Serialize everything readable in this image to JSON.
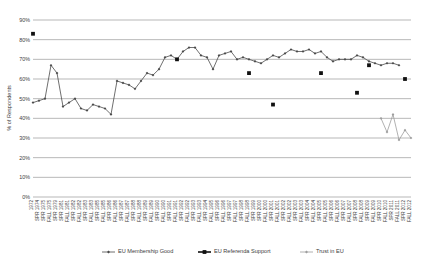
{
  "chart_data": {
    "type": "line",
    "title": "",
    "xlabel": "",
    "ylabel": "% of Respondents",
    "ylim": [
      0,
      90
    ],
    "ytick_step": 10,
    "ytick_labels": [
      "0%",
      "10%",
      "20%",
      "30%",
      "40%",
      "50%",
      "60%",
      "70%",
      "80%",
      "90%"
    ],
    "grid": true,
    "legend_position": "bottom",
    "categories": [
      "1972",
      "SPR 1974",
      "SPR 1975",
      "FALL 1975",
      "SPR 1979",
      "SPR 1981",
      "FALL 1981",
      "SPR 1982",
      "FALL 1982",
      "SPR 1983",
      "FALL 1983",
      "SPR 1985",
      "FALL 1985",
      "SPR 1986",
      "FALL 1986",
      "SPR 1987",
      "FALL 1987",
      "SPR 1988",
      "FALL 1988",
      "SPR 1989",
      "FALL 1989",
      "SPR 1990",
      "FALL 1990",
      "SPR 1991",
      "FALL 1991",
      "SPR 1992",
      "FALL 1992",
      "SPR 1993",
      "FALL 1993",
      "SPR 1994",
      "FALL 1995",
      "SPR 1996",
      "FALL 1996",
      "SPR 1997",
      "FALL 1997",
      "SPR 1998",
      "FALL 1998",
      "SPR 1999",
      "SPR 2000",
      "FALL 2000",
      "SPR 2001",
      "FALL 2001",
      "SPR 2002",
      "FALL 2002",
      "SPR 2003",
      "FALL 2003",
      "SPR 2004",
      "FALL 2004",
      "SPR 2005",
      "FALL 2005",
      "SPR 2006",
      "FALL 2006",
      "SPR 2007",
      "FALL 2007",
      "SPR 2008",
      "FALL 2008",
      "SPR 2009",
      "FALL 2009",
      "SPR 2010",
      "FALL 2010",
      "SPR 2011",
      "FALL 2011",
      "SPR 2012",
      "FALL 2012"
    ],
    "series": [
      {
        "name": "EU Membership Good",
        "color": "#4a4a4a",
        "marker": "diamond",
        "line_width": 0.8,
        "values": [
          48,
          49,
          50,
          67,
          63,
          46,
          48,
          50,
          45,
          44,
          47,
          46,
          45,
          42,
          59,
          58,
          57,
          55,
          59,
          63,
          62,
          65,
          71,
          72,
          70,
          74,
          76,
          76,
          72,
          71,
          65,
          72,
          73,
          74,
          70,
          71,
          70,
          69,
          68,
          70,
          72,
          71,
          73,
          75,
          74,
          74,
          75,
          73,
          74,
          71,
          69,
          70,
          70,
          70,
          72,
          71,
          69,
          68,
          67,
          68,
          68,
          67,
          null,
          null
        ]
      },
      {
        "name": "EU Referenda Support",
        "color": "#111111",
        "marker": "square",
        "line_width": 1.6,
        "values": [
          83,
          null,
          null,
          null,
          null,
          null,
          null,
          null,
          null,
          null,
          null,
          null,
          null,
          null,
          null,
          null,
          null,
          null,
          null,
          null,
          null,
          null,
          null,
          null,
          70,
          null,
          null,
          null,
          null,
          null,
          null,
          null,
          null,
          null,
          null,
          null,
          63,
          null,
          null,
          null,
          47,
          null,
          null,
          null,
          null,
          null,
          null,
          null,
          63,
          null,
          null,
          null,
          null,
          null,
          53,
          null,
          67,
          null,
          null,
          null,
          null,
          null,
          60,
          null
        ]
      },
      {
        "name": "Trust in EU",
        "color": "#9d9d9d",
        "marker": "diamond",
        "line_width": 0.8,
        "values": [
          null,
          null,
          null,
          null,
          null,
          null,
          null,
          null,
          null,
          null,
          null,
          null,
          null,
          null,
          null,
          null,
          null,
          null,
          null,
          null,
          null,
          null,
          null,
          null,
          null,
          null,
          null,
          null,
          null,
          null,
          null,
          null,
          null,
          null,
          null,
          null,
          null,
          null,
          null,
          null,
          null,
          null,
          null,
          null,
          null,
          null,
          null,
          null,
          null,
          null,
          null,
          null,
          null,
          null,
          null,
          null,
          null,
          null,
          40,
          33,
          42,
          29,
          34,
          30
        ]
      }
    ]
  },
  "legend": {
    "items": [
      {
        "label": "EU Membership Good"
      },
      {
        "label": "EU Referenda Support"
      },
      {
        "label": "Trust in EU"
      }
    ]
  }
}
